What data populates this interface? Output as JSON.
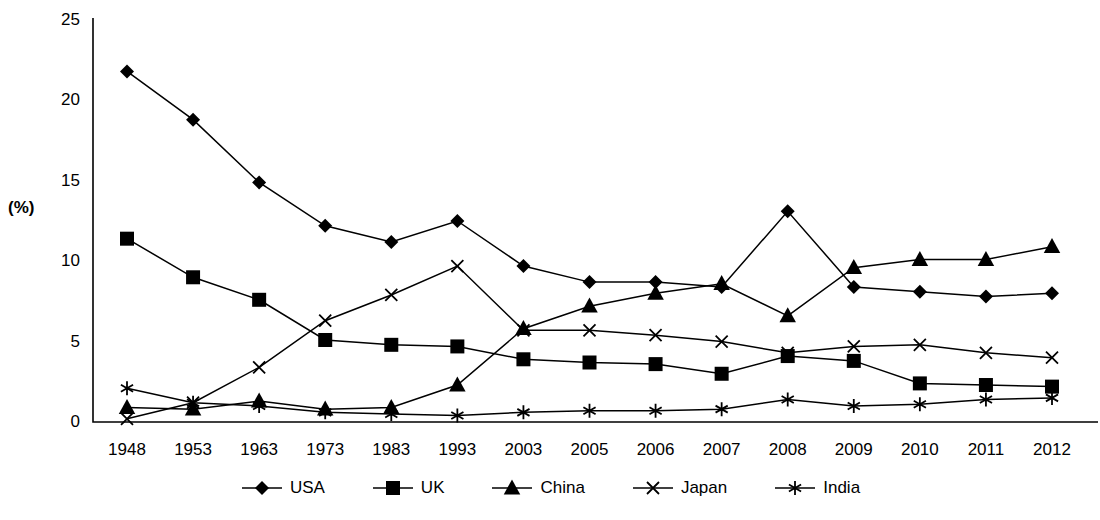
{
  "chart_data": {
    "type": "line",
    "title": "",
    "xlabel": "",
    "ylabel": "(%)",
    "ylim": [
      0,
      25
    ],
    "yticks": [
      0,
      5,
      10,
      15,
      20,
      25
    ],
    "grid": false,
    "legend_position": "bottom",
    "categories": [
      "1948",
      "1953",
      "1963",
      "1973",
      "1983",
      "1993",
      "2003",
      "2005",
      "2006",
      "2007",
      "2008",
      "2009",
      "2010",
      "2011",
      "2012"
    ],
    "series": [
      {
        "name": "USA",
        "marker": "diamond",
        "color": "#000000",
        "values": [
          21.8,
          18.8,
          14.9,
          12.2,
          11.2,
          12.5,
          9.7,
          8.7,
          8.7,
          8.4,
          13.1,
          8.4,
          8.1,
          7.8,
          8.0
        ]
      },
      {
        "name": "UK",
        "marker": "square",
        "color": "#000000",
        "values": [
          11.4,
          9.0,
          7.6,
          5.1,
          4.8,
          4.7,
          3.9,
          3.7,
          3.6,
          3.0,
          4.1,
          3.8,
          2.4,
          2.3,
          2.2
        ]
      },
      {
        "name": "China",
        "marker": "triangle",
        "color": "#000000",
        "values": [
          0.9,
          0.8,
          1.3,
          0.8,
          0.9,
          2.3,
          5.8,
          7.2,
          8.0,
          8.6,
          6.6,
          9.6,
          10.1,
          10.1,
          10.9
        ]
      },
      {
        "name": "Japan",
        "marker": "x",
        "color": "#000000",
        "values": [
          0.2,
          1.2,
          3.4,
          6.3,
          7.9,
          9.7,
          5.7,
          5.7,
          5.4,
          5.0,
          4.3,
          4.7,
          4.8,
          4.3,
          4.0
        ]
      },
      {
        "name": "India",
        "marker": "asterisk",
        "color": "#000000",
        "values": [
          2.1,
          1.2,
          1.0,
          0.6,
          0.5,
          0.4,
          0.6,
          0.7,
          0.7,
          0.8,
          1.4,
          1.0,
          1.1,
          1.4,
          1.5
        ]
      }
    ]
  },
  "axis": {
    "ylabel": "(%)"
  }
}
